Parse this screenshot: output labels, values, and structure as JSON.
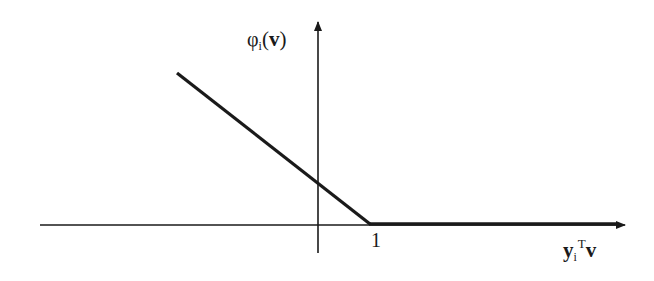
{
  "figure": {
    "type": "hinge-loss-plot",
    "y_axis_label": {
      "symbol": "φ",
      "subscript": "i",
      "open_paren": "(",
      "argument": "v",
      "close_paren": ")"
    },
    "x_axis_label": {
      "base": "y",
      "subscript": "i",
      "superscript": "T",
      "argument": "v"
    },
    "x_tick_label": "1",
    "colors": {
      "line": "#1a1a1a",
      "background": "#ffffff"
    },
    "geometry": {
      "origin_px": [
        318,
        225
      ],
      "y_axis_top_px": 20,
      "y_axis_bottom_px": 253,
      "x_axis_left_px": 40,
      "x_axis_right_px": 627,
      "curve_points_px": [
        [
          177,
          73
        ],
        [
          318,
          181
        ],
        [
          370,
          224
        ],
        [
          617,
          224
        ]
      ]
    },
    "function": {
      "description": "piecewise linear: decreasing line for x < 1, zero for x >= 1",
      "kink_x": 1,
      "y_intercept_relative": 0.83
    }
  }
}
